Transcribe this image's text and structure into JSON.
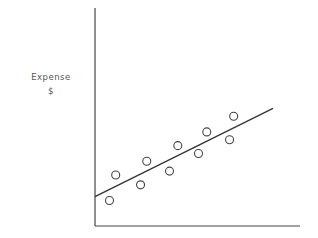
{
  "chart_data": {
    "type": "scatter",
    "title": "",
    "xlabel": "",
    "ylabel": "Expense",
    "ylabel_unit": "$",
    "grid": false,
    "legend": null,
    "x_ticks": [],
    "y_ticks": [],
    "points": [
      {
        "x": 0.07,
        "y": 0.13
      },
      {
        "x": 0.1,
        "y": 0.26
      },
      {
        "x": 0.22,
        "y": 0.21
      },
      {
        "x": 0.25,
        "y": 0.33
      },
      {
        "x": 0.36,
        "y": 0.28
      },
      {
        "x": 0.4,
        "y": 0.41
      },
      {
        "x": 0.5,
        "y": 0.37
      },
      {
        "x": 0.54,
        "y": 0.48
      },
      {
        "x": 0.65,
        "y": 0.44
      },
      {
        "x": 0.67,
        "y": 0.56
      }
    ],
    "trend_line": {
      "x0": 0.0,
      "y0": 0.15,
      "x1": 0.86,
      "y1": 0.6
    },
    "xlim": [
      0,
      1
    ],
    "ylim": [
      0,
      1
    ]
  },
  "labels": {
    "y_axis": "Expense",
    "y_unit": "$"
  }
}
